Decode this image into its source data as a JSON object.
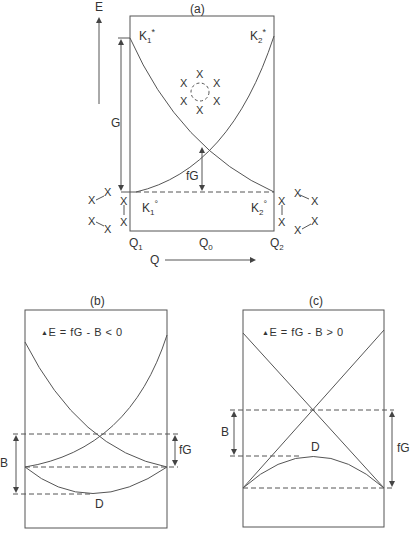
{
  "panels": {
    "a": {
      "title": "(a)",
      "axis_y": "E",
      "axis_x": "Q",
      "k1_star": "K",
      "k1_star_sub": "1",
      "k1_star_sup": "*",
      "k2_star": "K",
      "k2_star_sub": "2",
      "k2_star_sup": "*",
      "k1_ground": "K",
      "k1_ground_sub": "1",
      "k1_ground_sup": "°",
      "k2_ground": "K",
      "k2_ground_sub": "2",
      "k2_ground_sup": "°",
      "gap_label": "G",
      "barrier_label": "fG",
      "q1": "Q",
      "q1_sub": "1",
      "q0": "Q",
      "q0_sub": "0",
      "q2": "Q",
      "q2_sub": "2",
      "x_marker": "X"
    },
    "b": {
      "title": "(b)",
      "equation_delta": "▲",
      "equation": "E = fG - B < 0",
      "b_label": "B",
      "fg_label": "fG",
      "d_label": "D"
    },
    "c": {
      "title": "(c)",
      "equation_delta": "▲",
      "equation": "E = fG - B > 0",
      "b_label": "B",
      "fg_label": "fG",
      "d_label": "D"
    }
  },
  "colors": {
    "line": "#555555",
    "text": "#333333",
    "background": "#ffffff"
  }
}
